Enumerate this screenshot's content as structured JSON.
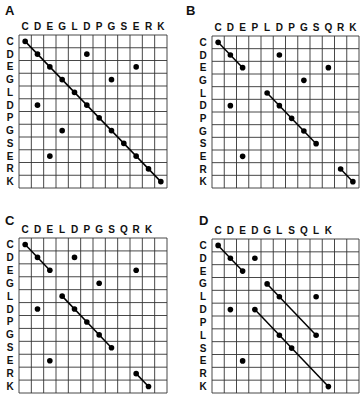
{
  "figure": {
    "panels": [
      {
        "letter": "A",
        "columns": [
          "C",
          "D",
          "E",
          "G",
          "L",
          "D",
          "P",
          "G",
          "S",
          "E",
          "R",
          "K"
        ],
        "rows": [
          "C",
          "D",
          "E",
          "G",
          "L",
          "D",
          "P",
          "G",
          "S",
          "E",
          "R",
          "K"
        ],
        "grid_cols": 12,
        "grid_rows": 12,
        "dots": [
          [
            0,
            0
          ],
          [
            1,
            1
          ],
          [
            1,
            5
          ],
          [
            2,
            2
          ],
          [
            2,
            9
          ],
          [
            3,
            3
          ],
          [
            3,
            7
          ],
          [
            4,
            4
          ],
          [
            5,
            5
          ],
          [
            5,
            1
          ],
          [
            6,
            6
          ],
          [
            7,
            7
          ],
          [
            7,
            3
          ],
          [
            8,
            8
          ],
          [
            9,
            9
          ],
          [
            9,
            2
          ],
          [
            10,
            10
          ],
          [
            11,
            11
          ]
        ],
        "lines": [
          [
            [
              0,
              0
            ],
            [
              11,
              11
            ]
          ]
        ]
      },
      {
        "letter": "B",
        "columns": [
          "C",
          "D",
          "E",
          "P",
          "L",
          "D",
          "P",
          "G",
          "S",
          "Q",
          "R",
          "K"
        ],
        "rows": [
          "C",
          "D",
          "E",
          "G",
          "L",
          "D",
          "P",
          "G",
          "S",
          "E",
          "R",
          "K"
        ],
        "grid_cols": 12,
        "grid_rows": 12,
        "dots": [
          [
            0,
            0
          ],
          [
            1,
            1
          ],
          [
            1,
            5
          ],
          [
            2,
            2
          ],
          [
            2,
            9
          ],
          [
            3,
            7
          ],
          [
            4,
            4
          ],
          [
            5,
            1
          ],
          [
            5,
            5
          ],
          [
            6,
            6
          ],
          [
            7,
            7
          ],
          [
            8,
            8
          ],
          [
            9,
            2
          ],
          [
            10,
            10
          ],
          [
            11,
            11
          ]
        ],
        "lines": [
          [
            [
              0,
              0
            ],
            [
              2,
              2
            ]
          ],
          [
            [
              4,
              4
            ],
            [
              8,
              8
            ]
          ],
          [
            [
              10,
              10
            ],
            [
              11,
              11
            ]
          ]
        ]
      },
      {
        "letter": "C",
        "columns": [
          "C",
          "D",
          "E",
          "L",
          "D",
          "P",
          "G",
          "S",
          "Q",
          "R",
          "K"
        ],
        "rows": [
          "C",
          "D",
          "E",
          "G",
          "L",
          "D",
          "P",
          "G",
          "S",
          "E",
          "R",
          "K"
        ],
        "grid_cols": 12,
        "grid_rows": 12,
        "dots": [
          [
            0,
            0
          ],
          [
            1,
            1
          ],
          [
            1,
            4
          ],
          [
            2,
            2
          ],
          [
            2,
            9
          ],
          [
            3,
            6
          ],
          [
            4,
            3
          ],
          [
            5,
            1
          ],
          [
            5,
            4
          ],
          [
            6,
            5
          ],
          [
            7,
            6
          ],
          [
            8,
            7
          ],
          [
            9,
            2
          ],
          [
            10,
            9
          ],
          [
            11,
            10
          ]
        ],
        "lines": [
          [
            [
              0,
              0
            ],
            [
              2,
              2
            ]
          ],
          [
            [
              4,
              3
            ],
            [
              8,
              7
            ]
          ],
          [
            [
              10,
              9
            ],
            [
              11,
              10
            ]
          ]
        ]
      },
      {
        "letter": "D",
        "columns": [
          "C",
          "D",
          "E",
          "D",
          "G",
          "L",
          "S",
          "Q",
          "L",
          "K"
        ],
        "rows": [
          "C",
          "D",
          "E",
          "G",
          "L",
          "D",
          "P",
          "L",
          "S",
          "E",
          "R",
          "K"
        ],
        "grid_cols": 12,
        "grid_rows": 12,
        "dots": [
          [
            0,
            0
          ],
          [
            1,
            1
          ],
          [
            1,
            3
          ],
          [
            2,
            2
          ],
          [
            3,
            4
          ],
          [
            4,
            5
          ],
          [
            4,
            8
          ],
          [
            5,
            1
          ],
          [
            5,
            3
          ],
          [
            7,
            5
          ],
          [
            7,
            8
          ],
          [
            8,
            6
          ],
          [
            9,
            2
          ],
          [
            11,
            9
          ]
        ],
        "lines": [
          [
            [
              0,
              0
            ],
            [
              2,
              2
            ]
          ],
          [
            [
              3,
              4
            ],
            [
              7,
              8
            ]
          ],
          [
            [
              5,
              3
            ],
            [
              11,
              9
            ]
          ]
        ]
      }
    ]
  }
}
